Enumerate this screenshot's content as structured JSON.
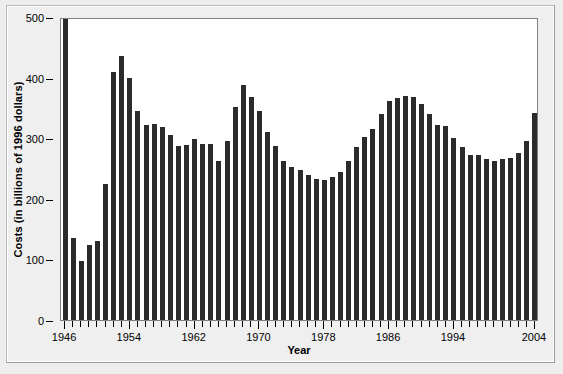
{
  "chart_data": {
    "type": "bar",
    "title": "",
    "subtitle": "",
    "xlabel": "Year",
    "ylabel": "Costs (in billions of 1996 dollars)",
    "xlim": [
      1946,
      2004
    ],
    "ylim": [
      0,
      500
    ],
    "yticks": [
      0,
      100,
      200,
      300,
      400,
      500
    ],
    "ytick_labels": [
      "0",
      "100",
      "200",
      "300",
      "400",
      "500"
    ],
    "xtick_labels": [
      "1946",
      "1954",
      "1962",
      "1970",
      "1978",
      "1986",
      "1994",
      "2004"
    ],
    "xtick_label_years": [
      1946,
      1954,
      1962,
      1970,
      1978,
      1986,
      1994,
      2004
    ],
    "xtick_every_year": true,
    "grid": false,
    "legend": null,
    "bar_color": "#2b2b2b",
    "plot_background": "#ffffff",
    "figure_background": "#efefef",
    "note_clipped_bars": "1946 value exceeds the 500 axis maximum and is drawn clipped at the top of the plot frame",
    "categories": [
      1946,
      1947,
      1948,
      1949,
      1950,
      1951,
      1952,
      1953,
      1954,
      1955,
      1956,
      1957,
      1958,
      1959,
      1960,
      1961,
      1962,
      1963,
      1964,
      1965,
      1966,
      1967,
      1968,
      1969,
      1970,
      1971,
      1972,
      1973,
      1974,
      1975,
      1976,
      1977,
      1978,
      1979,
      1980,
      1981,
      1982,
      1983,
      1984,
      1985,
      1986,
      1987,
      1988,
      1989,
      1990,
      1991,
      1992,
      1993,
      1994,
      1995,
      1996,
      1997,
      1998,
      1999,
      2000,
      2001,
      2002,
      2003,
      2004
    ],
    "values": [
      540,
      135,
      97,
      124,
      130,
      225,
      410,
      435,
      400,
      345,
      322,
      323,
      318,
      305,
      287,
      288,
      298,
      290,
      291,
      263,
      295,
      352,
      388,
      368,
      345,
      310,
      287,
      262,
      252,
      248,
      240,
      232,
      231,
      236,
      245,
      262,
      285,
      302,
      315,
      340,
      362,
      366,
      370,
      368,
      356,
      340,
      322,
      320,
      300,
      286,
      273,
      272,
      265,
      263,
      265,
      268,
      275,
      296,
      342
    ]
  },
  "y_axis": {
    "title": "Costs (in billions of 1996 dollars)"
  },
  "x_axis": {
    "title": "Year"
  }
}
